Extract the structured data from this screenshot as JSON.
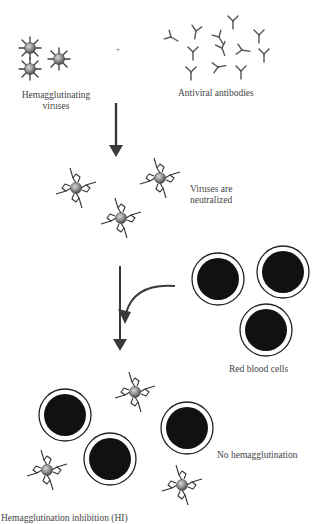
{
  "figure": {
    "labels": {
      "hemagglutinating_viruses": [
        "Hemagglutinating",
        "viruses"
      ],
      "antiviral_antibodies": "Antiviral antibodies",
      "plus_sign": "+",
      "viruses_neutralized": [
        "Viruses are",
        "neutralized"
      ],
      "red_blood_cells": "Red blood cells",
      "no_hemagglutination": "No hemagglutination",
      "caption": "Hemagglutination inhibition (HI)"
    },
    "colors": {
      "virus_core": "#8a8a8a",
      "spike": "#3a3a3a",
      "rbc_fill": "#111111",
      "arrow": "#3a3a3a",
      "background": "#ffffff"
    }
  }
}
